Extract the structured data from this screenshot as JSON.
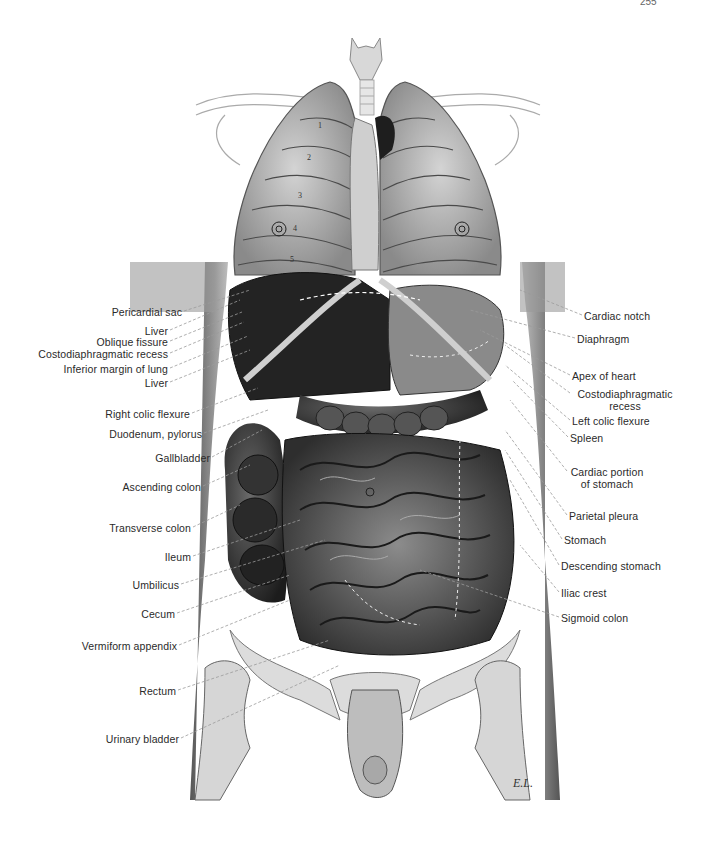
{
  "page": {
    "page_number_fragment": "255"
  },
  "figure": {
    "rib_numbers": [
      "1",
      "2",
      "3",
      "4",
      "5"
    ],
    "artist_signature": "E.L."
  },
  "labels_left": [
    {
      "text": "Pericardial sac",
      "x": 182,
      "y": 312,
      "tx": 250,
      "ty": 290
    },
    {
      "text": "Liver",
      "x": 168,
      "y": 331,
      "tx": 240,
      "ty": 300
    },
    {
      "text": "Oblique fissure",
      "x": 168,
      "y": 342,
      "tx": 242,
      "ty": 312
    },
    {
      "text": "Costodiaphragmatic recess",
      "x": 168,
      "y": 354,
      "tx": 244,
      "ty": 322
    },
    {
      "text": "Inferior margin of lung",
      "x": 168,
      "y": 369,
      "tx": 248,
      "ty": 336
    },
    {
      "text": "Liver",
      "x": 168,
      "y": 383,
      "tx": 250,
      "ty": 350
    },
    {
      "text": "Right colic flexure",
      "x": 190,
      "y": 414,
      "tx": 258,
      "ty": 388
    },
    {
      "text": "Duodenum, pylorus",
      "x": 202,
      "y": 434,
      "tx": 268,
      "ty": 410
    },
    {
      "text": "Gallbladder",
      "x": 210,
      "y": 458,
      "tx": 262,
      "ty": 430
    },
    {
      "text": "Ascending colon",
      "x": 201,
      "y": 487,
      "tx": 250,
      "ty": 465
    },
    {
      "text": "Transverse colon",
      "x": 191,
      "y": 528,
      "tx": 240,
      "ty": 505
    },
    {
      "text": "Ileum",
      "x": 191,
      "y": 557,
      "tx": 300,
      "ty": 520
    },
    {
      "text": "Umbilicus",
      "x": 179,
      "y": 585,
      "tx": 325,
      "ty": 540
    },
    {
      "text": "Cecum",
      "x": 175,
      "y": 614,
      "tx": 290,
      "ty": 575
    },
    {
      "text": "Vermiform appendix",
      "x": 177,
      "y": 646,
      "tx": 290,
      "ty": 600
    },
    {
      "text": "Rectum",
      "x": 176,
      "y": 691,
      "tx": 330,
      "ty": 640
    },
    {
      "text": "Urinary bladder",
      "x": 179,
      "y": 739,
      "tx": 340,
      "ty": 665
    }
  ],
  "labels_right": [
    {
      "text": "Cardiac notch",
      "x": 584,
      "y": 316,
      "tx": 520,
      "ty": 290
    },
    {
      "text": "Diaphragm",
      "x": 577,
      "y": 339,
      "tx": 470,
      "ty": 310
    },
    {
      "text": "Apex of heart",
      "x": 572,
      "y": 376,
      "tx": 480,
      "ty": 330
    },
    {
      "text": "Costodiaphragmatic",
      "x": 572,
      "y": 394,
      "tx": 505,
      "ty": 345,
      "line2": "recess"
    },
    {
      "text": "Left colic flexure",
      "x": 572,
      "y": 421,
      "tx": 505,
      "ty": 365
    },
    {
      "text": "Spleen",
      "x": 570,
      "y": 438,
      "tx": 512,
      "ty": 380
    },
    {
      "text": "Cardiac portion",
      "x": 569,
      "y": 472,
      "tx": 510,
      "ty": 400,
      "line2": "of stomach"
    },
    {
      "text": "Parietal pleura",
      "x": 569,
      "y": 516,
      "tx": 505,
      "ty": 430
    },
    {
      "text": "Stomach",
      "x": 564,
      "y": 540,
      "tx": 505,
      "ty": 450
    },
    {
      "text": "Descending stomach",
      "x": 561,
      "y": 566,
      "tx": 510,
      "ty": 480
    },
    {
      "text": "Iliac crest",
      "x": 561,
      "y": 593,
      "tx": 520,
      "ty": 545
    },
    {
      "text": "Sigmoid colon",
      "x": 561,
      "y": 618,
      "tx": 420,
      "ty": 570
    }
  ],
  "colors": {
    "background": "#ffffff",
    "text": "#2a2a2a",
    "leader_line": "#9a9a9a",
    "organ_dark": "#2b2b2b",
    "organ_mid": "#6e6e6e",
    "bone": "#d8d8d8",
    "lung": "#b8b8b8"
  }
}
